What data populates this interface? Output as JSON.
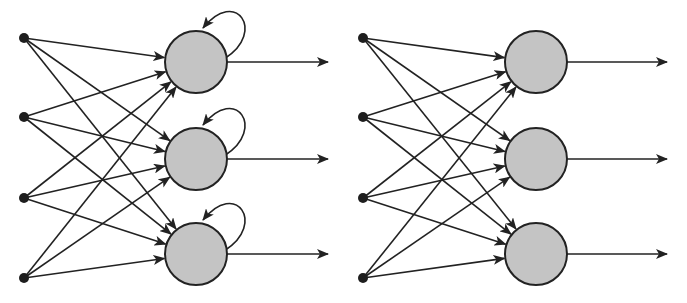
{
  "diagram": {
    "title": "",
    "colors": {
      "background": "#ffffff",
      "stroke": "#222222",
      "neuron_fill": "#c4c4c4",
      "input_fill": "#1e1e1e"
    },
    "networks": [
      {
        "name": "recurrent-network",
        "recurrent": true,
        "input_x": 24,
        "neuron_x": 196,
        "output_end_x": 328,
        "input_ys": [
          38,
          117,
          198,
          278
        ],
        "neuron_ys": [
          62,
          159,
          254
        ],
        "neuron_radius": 31
      },
      {
        "name": "feedforward-network",
        "recurrent": false,
        "input_x": 363,
        "neuron_x": 536,
        "output_end_x": 667,
        "input_ys": [
          38,
          117,
          198,
          278
        ],
        "neuron_ys": [
          62,
          159,
          254
        ],
        "neuron_radius": 31
      }
    ]
  }
}
